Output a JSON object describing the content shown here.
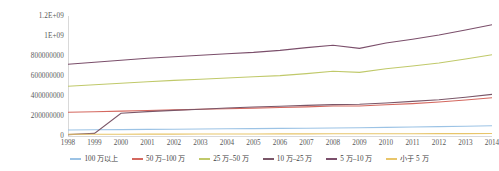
{
  "chart_data": {
    "type": "line",
    "title": "",
    "xlabel": "",
    "ylabel": "",
    "grid": false,
    "legend_position": "bottom",
    "x": [
      1998,
      1999,
      2000,
      2001,
      2002,
      2003,
      2004,
      2005,
      2006,
      2007,
      2008,
      2009,
      2010,
      2011,
      2012,
      2013,
      2014
    ],
    "xtick_labels": [
      "1998",
      "1999",
      "2000",
      "2001",
      "2002",
      "2003",
      "2004",
      "2005",
      "2006",
      "2007",
      "2008",
      "2009",
      "2010",
      "2011",
      "2012",
      "2013",
      "2014"
    ],
    "ytick_labels": [
      "1.2E+09",
      "1E+09",
      "800000000",
      "600000000",
      "400000000",
      "200000000",
      "0"
    ],
    "ytick_values": [
      1200000000,
      1000000000,
      800000000,
      600000000,
      400000000,
      200000000,
      0
    ],
    "ylim": [
      0,
      1200000000
    ],
    "series": [
      {
        "name": "100 万以上",
        "color": "#9cc3e5",
        "values": [
          60000000,
          62000000,
          64000000,
          66000000,
          68000000,
          70000000,
          72000000,
          74000000,
          76000000,
          78000000,
          80000000,
          82000000,
          86000000,
          90000000,
          94000000,
          98000000,
          102000000
        ]
      },
      {
        "name": "50 万–100 万",
        "color": "#d4685f",
        "values": [
          237000000,
          243000000,
          249000000,
          255000000,
          261000000,
          267000000,
          273000000,
          279000000,
          285000000,
          291000000,
          300000000,
          300000000,
          312000000,
          324000000,
          340000000,
          360000000,
          382000000
        ]
      },
      {
        "name": "25 万–50 万",
        "color": "#c0c96a",
        "values": [
          498000000,
          513000000,
          528000000,
          543000000,
          556000000,
          568000000,
          580000000,
          592000000,
          604000000,
          624000000,
          648000000,
          636000000,
          672000000,
          700000000,
          730000000,
          770000000,
          812000000
        ]
      },
      {
        "name": "10 万–25 万",
        "color": "#7a5668",
        "values": [
          14000000,
          26000000,
          228000000,
          244000000,
          256000000,
          268000000,
          280000000,
          290000000,
          298000000,
          306000000,
          314000000,
          318000000,
          330000000,
          346000000,
          362000000,
          388000000,
          416000000
        ]
      },
      {
        "name": "5 万–10 万",
        "color": "#7b4f6b",
        "values": [
          717000000,
          737000000,
          757000000,
          777000000,
          793000000,
          808000000,
          822000000,
          836000000,
          856000000,
          884000000,
          908000000,
          876000000,
          930000000,
          968000000,
          1010000000,
          1060000000,
          1112000000
        ]
      },
      {
        "name": "小于 5 万",
        "color": "#e8c56a",
        "values": [
          18000000,
          18000000,
          18000000,
          18500000,
          19000000,
          19500000,
          20000000,
          20500000,
          21000000,
          21500000,
          22000000,
          22000000,
          22500000,
          23000000,
          23500000,
          24000000,
          24500000
        ]
      }
    ]
  },
  "axis": {
    "line_color": "#d9d9d9",
    "tick_color": "#595959"
  }
}
